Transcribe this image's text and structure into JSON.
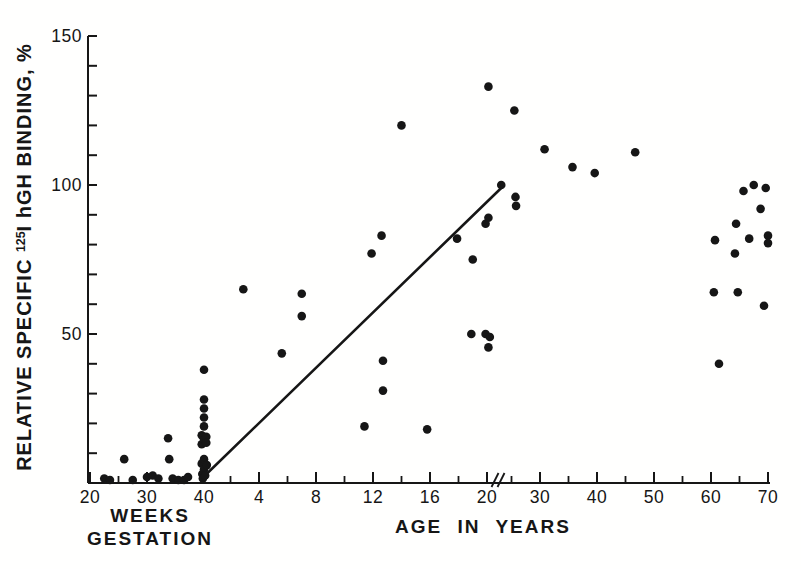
{
  "chart_data": {
    "type": "scatter",
    "title": "",
    "ylabel": "RELATIVE SPECIFIC ¹²⁵I hGH BINDING, %",
    "ylabel_parts": {
      "prefix": "RELATIVE SPECIFIC ",
      "superscript": "125",
      "suffix": "I hGH BINDING, %"
    },
    "xlabel_gestation_lines": [
      "WEEKS",
      "GESTATION"
    ],
    "xlabel_years": "AGE IN YEARS",
    "ylim": [
      0,
      150
    ],
    "y_major_ticks": [
      50,
      100,
      150
    ],
    "y_minor_step": 10,
    "x_gestation": {
      "unit": "weeks gestation",
      "labeled_ticks": [
        20,
        30,
        40
      ],
      "minor_ticks": [
        25,
        35
      ],
      "range": [
        20,
        40
      ]
    },
    "x_years": {
      "unit": "age in years",
      "labeled_ticks": [
        4,
        8,
        12,
        16,
        20,
        30,
        40,
        50,
        60,
        70
      ],
      "minor_ticks": [
        2,
        6,
        10,
        14,
        18,
        25,
        35,
        45,
        55,
        65
      ],
      "axis_break_after": 20
    },
    "grid": false,
    "legend": "none",
    "dot_color": "#161616",
    "axis_color": "#161616",
    "series": [
      {
        "name": "fetal samples (weeks gestation)",
        "x_unit": "weeks",
        "points": [
          [
            22.5,
            1.5
          ],
          [
            23.5,
            1
          ],
          [
            26,
            8
          ],
          [
            27.5,
            1
          ],
          [
            30,
            2
          ],
          [
            31,
            2.5
          ],
          [
            32,
            1.5
          ],
          [
            33.7,
            15
          ],
          [
            33.9,
            8
          ],
          [
            34.5,
            1.5
          ],
          [
            35.5,
            1
          ],
          [
            36.5,
            1
          ],
          [
            37.2,
            2
          ],
          [
            39.6,
            16
          ],
          [
            39.6,
            13
          ],
          [
            39.6,
            6.5
          ],
          [
            39.7,
            3
          ],
          [
            39.8,
            1.5
          ],
          [
            40,
            38
          ],
          [
            40,
            28
          ],
          [
            40,
            25
          ],
          [
            40,
            22
          ],
          [
            40,
            19
          ],
          [
            40,
            14.5
          ],
          [
            40,
            8
          ],
          [
            40,
            4.5
          ],
          [
            40.2,
            2.5
          ],
          [
            40.4,
            15.5
          ],
          [
            40.4,
            13.5
          ],
          [
            40.5,
            6
          ]
        ]
      },
      {
        "name": "postnatal samples (age in years)",
        "x_unit": "years",
        "points": [
          [
            2.9,
            65
          ],
          [
            5.6,
            43.5
          ],
          [
            7,
            63.5
          ],
          [
            7,
            56
          ],
          [
            11.4,
            19
          ],
          [
            11.9,
            77
          ],
          [
            12.6,
            83
          ],
          [
            12.7,
            41
          ],
          [
            12.7,
            31
          ],
          [
            14,
            120
          ],
          [
            15.8,
            18
          ],
          [
            17.9,
            82
          ],
          [
            18.9,
            50
          ],
          [
            19,
            75
          ],
          [
            19.9,
            87
          ],
          [
            20.1,
            89
          ],
          [
            19.9,
            50
          ],
          [
            20.2,
            49
          ],
          [
            20.1,
            45.5
          ],
          [
            20.1,
            133
          ],
          [
            21,
            100
          ],
          [
            25.5,
            125
          ],
          [
            25.7,
            96
          ],
          [
            25.8,
            93
          ],
          [
            30.8,
            112
          ],
          [
            35.7,
            106
          ],
          [
            39.6,
            104
          ],
          [
            46.7,
            111
          ],
          [
            60.5,
            64
          ],
          [
            60.7,
            81.5
          ],
          [
            61.4,
            40
          ],
          [
            64.2,
            77
          ],
          [
            64.4,
            87
          ],
          [
            64.7,
            64
          ],
          [
            65.7,
            98
          ],
          [
            66.7,
            82
          ],
          [
            67.5,
            100
          ],
          [
            68.7,
            92
          ],
          [
            69.3,
            59.5
          ],
          [
            69.6,
            99
          ],
          [
            70,
            83
          ],
          [
            70,
            80.5
          ]
        ]
      }
    ],
    "trend_line": {
      "x1_years": 0.1,
      "y1": 2,
      "x2_years": 21,
      "y2": 99
    }
  }
}
